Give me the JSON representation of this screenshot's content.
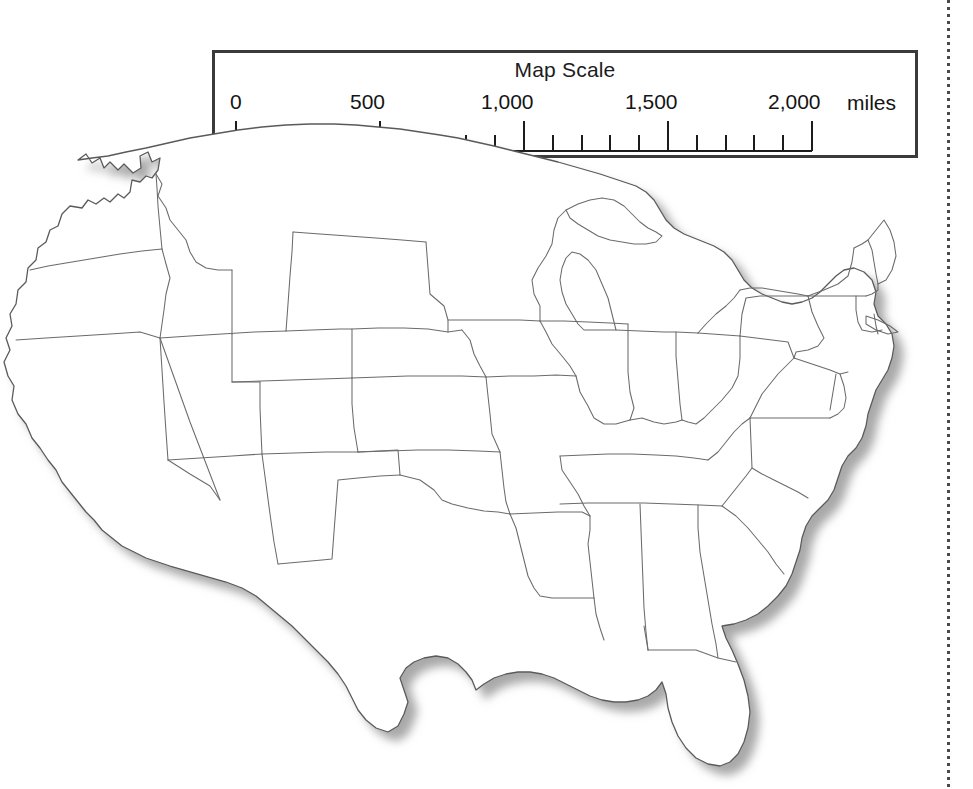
{
  "page": {
    "background_color": "#ffffff",
    "width": 973,
    "height": 789,
    "kind": "printed-textbook-page"
  },
  "scale_legend": {
    "title": "Map Scale",
    "unit_label": "miles",
    "border_color": "#3a3a3a",
    "tick_color": "#1c1c1c",
    "major_ticks": [
      {
        "value": 0,
        "label": "0"
      },
      {
        "value": 500,
        "label": "500"
      },
      {
        "value": 1000,
        "label": "1,000"
      },
      {
        "value": 1500,
        "label": "1,500"
      },
      {
        "value": 2000,
        "label": "2,000"
      }
    ],
    "minor_tick_interval": 100,
    "minor_tick_count": 20,
    "range_min": 0,
    "range_max": 2000,
    "labels": {
      "t0": "0",
      "t500": "500",
      "t1000": "1,000",
      "t1500": "1,500",
      "t2000": "2,000",
      "unit": "miles"
    }
  },
  "map": {
    "region": "United States (contiguous 48 states)",
    "style": "blank state outline map",
    "outline_color": "#5a5a5a",
    "fill_color": "#ffffff",
    "shadow_color": "#b9b9b9",
    "has_state_borders": true,
    "has_labels": false,
    "has_drop_shadow": true
  },
  "margin_rule": {
    "style": "dotted",
    "color": "#4a4a4a",
    "orientation": "vertical"
  }
}
